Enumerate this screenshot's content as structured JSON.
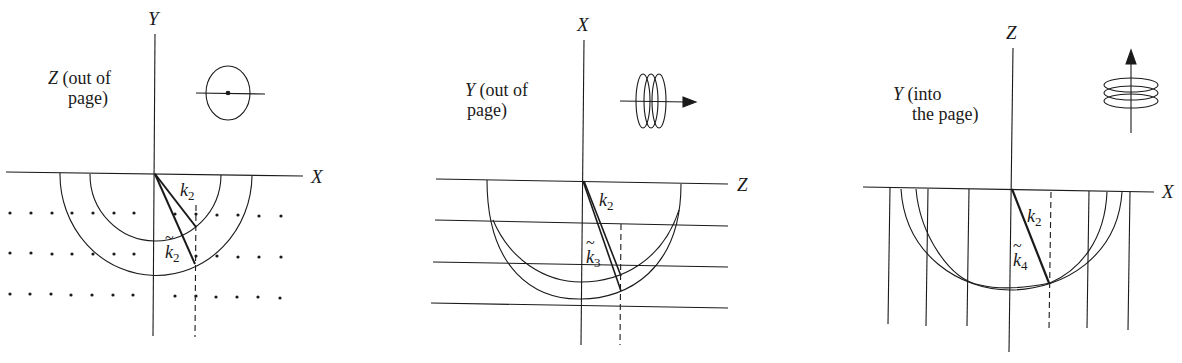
{
  "figure": {
    "panels": [
      {
        "id": "a",
        "vertical_axis": "Y",
        "horizontal_axis": "X",
        "note_axis": "Z",
        "note_rest_line1": " (out of",
        "note_line2": "page)",
        "vector_k": "k",
        "vector_k_sub": "2",
        "vector_kt": "k",
        "vector_kt_sub": "2",
        "icon": "single-disc-end-on-icon",
        "background": "dot-grid"
      },
      {
        "id": "b",
        "vertical_axis": "X",
        "horizontal_axis": "Z",
        "note_axis": "Y",
        "note_rest_line1": " (out of",
        "note_line2": "page)",
        "vector_k": "k",
        "vector_k_sub": "2",
        "vector_kt": "k",
        "vector_kt_sub": "3",
        "icon": "stacked-discs-horizontal-arrow-icon",
        "background": "horizontal-lines"
      },
      {
        "id": "c",
        "vertical_axis": "Z",
        "horizontal_axis": "X",
        "note_axis": "Y",
        "note_rest_line1": " (into",
        "note_line2": "the page)",
        "vector_k": "k",
        "vector_k_sub": "2",
        "vector_kt": "k",
        "vector_kt_sub": "4",
        "icon": "stacked-discs-vertical-arrow-icon",
        "background": "vertical-lines"
      }
    ]
  },
  "colors": {
    "ink": "#1a1a1a",
    "background": "#ffffff"
  }
}
